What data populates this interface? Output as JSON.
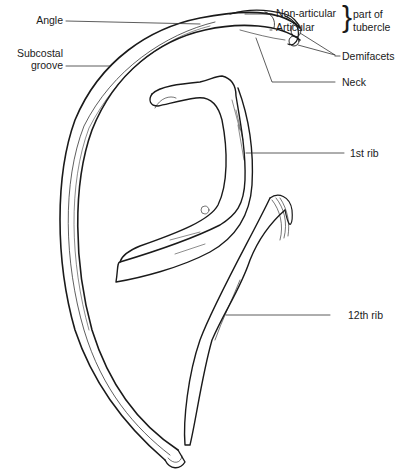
{
  "diagram": {
    "type": "anatomical-illustration",
    "labels": {
      "angle": "Angle",
      "subcostal_line1": "Subcostal",
      "subcostal_line2": "groove",
      "non_articular": "Non-articular",
      "articular": "Articular",
      "part_of": "part of",
      "tubercle": "tubercle",
      "demifacets": "Demifacets",
      "neck": "Neck",
      "first_rib": "1st rib",
      "twelfth_rib": "12th rib"
    },
    "colors": {
      "ink": "#1a1a1a",
      "background": "#ffffff",
      "leader": "#333333"
    }
  }
}
